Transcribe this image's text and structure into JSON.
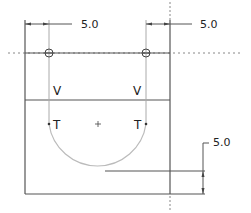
{
  "drawing": {
    "colors": {
      "line": "#555555",
      "construction": "#aaaaaa",
      "arc": "#bbbbbb",
      "text": "#222222",
      "background": "#ffffff"
    },
    "dimensions": [
      {
        "id": "top-left",
        "value": "5.0"
      },
      {
        "id": "top-right",
        "value": "5.0"
      },
      {
        "id": "right-bottom",
        "value": "5.0"
      }
    ],
    "labels": {
      "vertical_left": "V",
      "vertical_right": "V",
      "tangent_left": "T",
      "tangent_right": "T"
    }
  }
}
